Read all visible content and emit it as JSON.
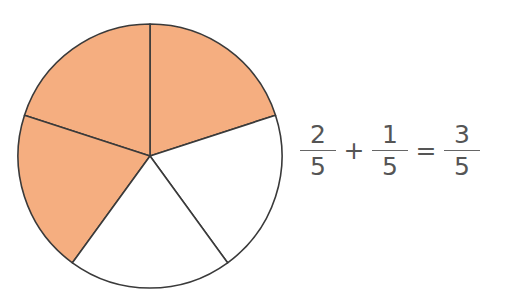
{
  "diagram": {
    "type": "fraction-pie",
    "total_parts": 5,
    "shaded_parts": 3,
    "shade_color": "#F5AE80",
    "stroke_color": "#333333"
  },
  "equation": {
    "term1": {
      "numerator": "2",
      "denominator": "5"
    },
    "plus": "+",
    "term2": {
      "numerator": "1",
      "denominator": "5"
    },
    "equals": "=",
    "result": {
      "numerator": "3",
      "denominator": "5"
    }
  }
}
